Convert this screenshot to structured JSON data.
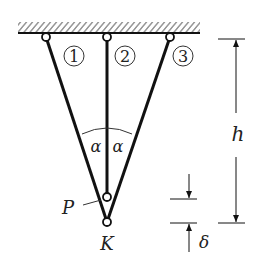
{
  "diagram": {
    "bars": [
      {
        "id": "1",
        "label": "1"
      },
      {
        "id": "2",
        "label": "2"
      },
      {
        "id": "3",
        "label": "3"
      }
    ],
    "angle_label_left": "α",
    "angle_label_right": "α",
    "point_P": "P",
    "point_K": "K",
    "dimension_h": "h",
    "dimension_delta": "δ"
  }
}
